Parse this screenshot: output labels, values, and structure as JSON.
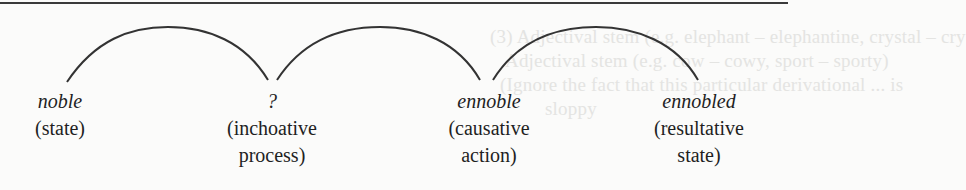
{
  "diagram": {
    "type": "derivational-chain",
    "nodes": [
      {
        "term": "noble",
        "gloss_lines": [
          "(state)"
        ]
      },
      {
        "term": "?",
        "gloss_lines": [
          "(inchoative",
          "process)"
        ]
      },
      {
        "term": "ennoble",
        "gloss_lines": [
          "(causative",
          "action)"
        ]
      },
      {
        "term": "ennobled",
        "gloss_lines": [
          "(resultative",
          "state)"
        ]
      }
    ],
    "arcs": [
      {
        "from": 0,
        "to": 1
      },
      {
        "from": 1,
        "to": 2
      },
      {
        "from": 2,
        "to": 3
      }
    ],
    "colors": {
      "ink": "#1f1f1f",
      "arc": "#333333",
      "rule": "#3a3a3a",
      "background": "#fbfbfa",
      "bleed_through": "#e4e4e2"
    }
  },
  "bleed_through": {
    "lines": [
      "(3) Adjectival stem (e.g. elephant – elephantine, crystal – cry",
      "Adjectival stem (e.g. cow – cowy, sport – sporty)",
      "(Ignore the fact that this particular derivational ... is",
      "sloppy"
    ]
  }
}
